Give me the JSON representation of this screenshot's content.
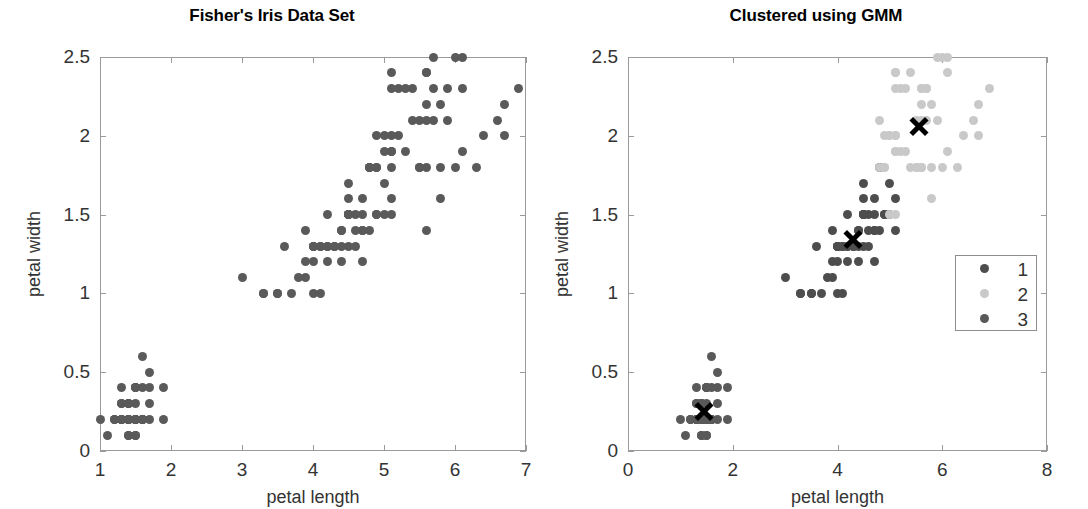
{
  "figure": {
    "width": 1088,
    "height": 509,
    "background": "#ffffff"
  },
  "colors": {
    "cluster1": "#4d4d4d",
    "cluster2": "#c9c9c9",
    "cluster3": "#595959",
    "raw_points": "#5a5a5a",
    "centroid": "#000000",
    "axis": "#9a9a9a",
    "text": "#333333"
  },
  "panels": [
    {
      "id": "left",
      "title": "Fisher's Iris Data Set",
      "xlabel": "petal length",
      "ylabel": "petal width",
      "xticks": [
        1,
        2,
        3,
        4,
        5,
        6,
        7
      ],
      "xtick_labels": [
        "1",
        "2",
        "3",
        "4",
        "5",
        "6",
        "7"
      ],
      "yticks": [
        0,
        0.5,
        1,
        1.5,
        2,
        2.5
      ],
      "ytick_labels": [
        "0",
        "0.5",
        "1",
        "1.5",
        "2",
        "2.5"
      ],
      "xlim": [
        1,
        7
      ],
      "ylim": [
        0,
        2.5
      ]
    },
    {
      "id": "right",
      "title": "Clustered using GMM",
      "xlabel": "petal length",
      "ylabel": "petal width",
      "xticks": [
        0,
        2,
        4,
        6,
        8
      ],
      "xtick_labels": [
        "0",
        "2",
        "4",
        "6",
        "8"
      ],
      "yticks": [
        0,
        0.5,
        1,
        1.5,
        2,
        2.5
      ],
      "ytick_labels": [
        "0",
        "0.5",
        "1",
        "1.5",
        "2",
        "2.5"
      ],
      "xlim": [
        0,
        8
      ],
      "ylim": [
        0,
        2.5
      ]
    }
  ],
  "legend": {
    "entries": [
      {
        "label": "1",
        "color": "#4d4d4d"
      },
      {
        "label": "2",
        "color": "#c9c9c9"
      },
      {
        "label": "3",
        "color": "#595959"
      }
    ]
  },
  "chart_data": {
    "type": "scatter",
    "xlabel": "petal length",
    "ylabel": "petal width",
    "grid": false,
    "legend_position": "right-inside",
    "panels": [
      {
        "title": "Fisher's Iris Data Set",
        "xlim": [
          1,
          7
        ],
        "ylim": [
          0,
          2.5
        ],
        "xticks": [
          1,
          2,
          3,
          4,
          5,
          6,
          7
        ],
        "yticks": [
          0,
          0.5,
          1,
          1.5,
          2,
          2.5
        ],
        "series": [
          {
            "name": "all-points",
            "color": "#5a5a5a",
            "marker": "circle",
            "x": [
              1.4,
              1.4,
              1.3,
              1.5,
              1.4,
              1.7,
              1.4,
              1.5,
              1.4,
              1.5,
              1.5,
              1.6,
              1.4,
              1.1,
              1.2,
              1.5,
              1.3,
              1.4,
              1.7,
              1.5,
              1.7,
              1.5,
              1.0,
              1.7,
              1.9,
              1.6,
              1.6,
              1.5,
              1.4,
              1.6,
              1.6,
              1.5,
              1.5,
              1.4,
              1.5,
              1.2,
              1.3,
              1.4,
              1.3,
              1.5,
              1.3,
              1.3,
              1.3,
              1.6,
              1.9,
              1.4,
              1.6,
              1.4,
              1.5,
              1.4,
              4.7,
              4.5,
              4.9,
              4.0,
              4.6,
              4.5,
              4.7,
              3.3,
              4.6,
              3.9,
              3.5,
              4.2,
              4.0,
              4.7,
              3.6,
              4.4,
              4.5,
              4.1,
              4.5,
              3.9,
              4.8,
              4.0,
              4.9,
              4.7,
              4.3,
              4.4,
              4.8,
              5.0,
              4.5,
              3.5,
              3.8,
              3.7,
              3.9,
              5.1,
              4.5,
              4.5,
              4.7,
              4.4,
              4.1,
              4.0,
              4.4,
              4.6,
              4.0,
              3.3,
              4.2,
              4.2,
              4.2,
              4.3,
              3.0,
              4.1,
              6.0,
              5.1,
              5.9,
              5.6,
              5.8,
              6.6,
              4.5,
              6.3,
              5.8,
              6.1,
              5.1,
              5.3,
              5.5,
              5.0,
              5.1,
              5.3,
              5.5,
              6.7,
              6.9,
              5.0,
              5.7,
              4.9,
              6.7,
              4.9,
              5.7,
              6.0,
              4.8,
              4.9,
              5.6,
              5.8,
              6.1,
              6.4,
              5.6,
              5.1,
              5.6,
              6.1,
              5.6,
              5.5,
              4.8,
              5.4,
              5.6,
              5.1,
              5.1,
              5.9,
              5.7,
              5.2,
              5.0,
              5.2,
              5.4,
              5.1
            ],
            "y": [
              0.2,
              0.2,
              0.2,
              0.2,
              0.2,
              0.4,
              0.3,
              0.2,
              0.2,
              0.1,
              0.2,
              0.2,
              0.1,
              0.1,
              0.2,
              0.4,
              0.4,
              0.3,
              0.3,
              0.3,
              0.2,
              0.4,
              0.2,
              0.5,
              0.2,
              0.2,
              0.4,
              0.2,
              0.2,
              0.2,
              0.2,
              0.4,
              0.1,
              0.2,
              0.2,
              0.2,
              0.2,
              0.1,
              0.2,
              0.2,
              0.3,
              0.3,
              0.2,
              0.6,
              0.4,
              0.3,
              0.2,
              0.2,
              0.2,
              0.2,
              1.4,
              1.5,
              1.5,
              1.3,
              1.5,
              1.3,
              1.6,
              1.0,
              1.3,
              1.4,
              1.0,
              1.5,
              1.0,
              1.4,
              1.3,
              1.4,
              1.5,
              1.0,
              1.5,
              1.1,
              1.8,
              1.3,
              1.5,
              1.2,
              1.3,
              1.4,
              1.4,
              1.7,
              1.5,
              1.0,
              1.1,
              1.0,
              1.2,
              1.6,
              1.5,
              1.6,
              1.5,
              1.3,
              1.3,
              1.3,
              1.2,
              1.4,
              1.2,
              1.0,
              1.3,
              1.2,
              1.3,
              1.3,
              1.1,
              1.3,
              2.5,
              1.9,
              2.1,
              1.8,
              2.2,
              2.1,
              1.7,
              1.8,
              1.8,
              2.5,
              2.0,
              1.9,
              2.1,
              2.0,
              2.4,
              2.3,
              1.8,
              2.2,
              2.3,
              1.5,
              2.3,
              2.0,
              2.0,
              1.8,
              2.1,
              1.8,
              1.8,
              1.8,
              2.1,
              1.6,
              1.9,
              2.0,
              2.2,
              1.5,
              1.4,
              2.3,
              2.4,
              1.8,
              1.8,
              2.1,
              2.4,
              2.3,
              1.9,
              2.3,
              2.5,
              2.3,
              1.9,
              2.0,
              2.3,
              1.8
            ]
          }
        ]
      },
      {
        "title": "Clustered using GMM",
        "xlim": [
          0,
          8
        ],
        "ylim": [
          0,
          2.5
        ],
        "xticks": [
          0,
          2,
          4,
          6,
          8
        ],
        "yticks": [
          0,
          0.5,
          1,
          1.5,
          2,
          2.5
        ],
        "series": [
          {
            "name": "1",
            "color": "#4d4d4d",
            "marker": "circle",
            "x": [
              4.7,
              4.5,
              4.9,
              4.0,
              4.6,
              4.5,
              4.7,
              3.3,
              4.6,
              3.9,
              3.5,
              4.2,
              4.0,
              4.7,
              3.6,
              4.4,
              4.5,
              4.1,
              4.5,
              3.9,
              4.8,
              4.0,
              4.9,
              4.7,
              4.3,
              4.4,
              4.8,
              5.0,
              4.5,
              3.5,
              3.8,
              3.7,
              3.9,
              5.1,
              4.5,
              4.5,
              4.7,
              4.4,
              4.1,
              4.0,
              4.4,
              4.6,
              4.0,
              3.3,
              4.2,
              4.2,
              4.2,
              4.3,
              3.0,
              4.1,
              4.5,
              5.0,
              5.1
            ],
            "y": [
              1.4,
              1.5,
              1.5,
              1.3,
              1.5,
              1.3,
              1.6,
              1.0,
              1.3,
              1.4,
              1.0,
              1.5,
              1.0,
              1.4,
              1.3,
              1.4,
              1.5,
              1.0,
              1.5,
              1.1,
              1.8,
              1.3,
              1.5,
              1.2,
              1.3,
              1.4,
              1.4,
              1.7,
              1.5,
              1.0,
              1.1,
              1.0,
              1.2,
              1.6,
              1.5,
              1.6,
              1.5,
              1.3,
              1.3,
              1.3,
              1.2,
              1.4,
              1.2,
              1.0,
              1.3,
              1.2,
              1.3,
              1.3,
              1.1,
              1.3,
              1.7,
              1.5,
              1.4
            ],
            "centroid": [
              4.3,
              1.34
            ]
          },
          {
            "name": "2",
            "color": "#c9c9c9",
            "marker": "circle",
            "x": [
              6.0,
              5.1,
              5.9,
              5.6,
              5.8,
              6.6,
              6.3,
              5.8,
              6.1,
              5.1,
              5.3,
              5.5,
              5.0,
              5.1,
              5.3,
              5.5,
              6.7,
              6.9,
              5.0,
              5.7,
              4.9,
              6.7,
              4.9,
              5.7,
              6.0,
              4.8,
              4.9,
              5.6,
              5.8,
              6.1,
              6.4,
              5.6,
              5.1,
              5.6,
              6.1,
              5.6,
              5.5,
              4.8,
              5.4,
              5.6,
              5.1,
              5.1,
              5.9,
              5.7,
              5.2,
              5.0,
              5.2,
              5.4,
              5.1,
              5.1
            ],
            "y": [
              2.5,
              1.9,
              2.1,
              1.8,
              2.2,
              2.1,
              1.8,
              1.8,
              2.5,
              2.0,
              1.9,
              2.1,
              2.0,
              2.4,
              2.3,
              1.8,
              2.2,
              2.3,
              1.5,
              2.3,
              2.0,
              2.0,
              1.8,
              2.1,
              1.8,
              1.8,
              1.8,
              2.1,
              1.6,
              1.9,
              2.0,
              2.2,
              1.5,
              2.3,
              2.4,
              1.8,
              1.8,
              2.1,
              2.4,
              2.3,
              1.9,
              2.3,
              2.5,
              2.3,
              1.9,
              2.0,
              2.3,
              1.8,
              2.0,
              2.4
            ],
            "centroid": [
              5.55,
              2.06
            ]
          },
          {
            "name": "3",
            "color": "#595959",
            "marker": "circle",
            "x": [
              1.4,
              1.4,
              1.3,
              1.5,
              1.4,
              1.7,
              1.4,
              1.5,
              1.4,
              1.5,
              1.5,
              1.6,
              1.4,
              1.1,
              1.2,
              1.5,
              1.3,
              1.4,
              1.7,
              1.5,
              1.7,
              1.5,
              1.0,
              1.7,
              1.9,
              1.6,
              1.6,
              1.5,
              1.4,
              1.6,
              1.6,
              1.5,
              1.5,
              1.4,
              1.5,
              1.2,
              1.3,
              1.4,
              1.3,
              1.5,
              1.3,
              1.3,
              1.3,
              1.6,
              1.9,
              1.4,
              1.6,
              1.4,
              1.5,
              1.4
            ],
            "y": [
              0.2,
              0.2,
              0.2,
              0.2,
              0.2,
              0.4,
              0.3,
              0.2,
              0.2,
              0.1,
              0.2,
              0.2,
              0.1,
              0.1,
              0.2,
              0.4,
              0.4,
              0.3,
              0.3,
              0.3,
              0.2,
              0.4,
              0.2,
              0.5,
              0.2,
              0.2,
              0.4,
              0.2,
              0.2,
              0.2,
              0.2,
              0.4,
              0.1,
              0.2,
              0.2,
              0.2,
              0.2,
              0.1,
              0.2,
              0.2,
              0.3,
              0.3,
              0.2,
              0.6,
              0.4,
              0.3,
              0.2,
              0.2,
              0.2,
              0.2
            ],
            "centroid": [
              1.46,
              0.25
            ]
          }
        ]
      }
    ]
  }
}
